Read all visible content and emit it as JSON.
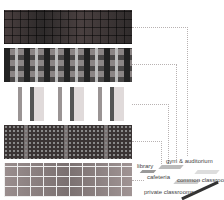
{
  "diagram": {
    "layers": [
      {
        "id": "layer-1",
        "label": "gym & auditorium"
      },
      {
        "id": "layer-2",
        "label": "common classrooms"
      },
      {
        "id": "layer-3",
        "label": "library"
      },
      {
        "id": "layer-4",
        "label": "cafeteria"
      },
      {
        "id": "layer-5",
        "label": "private classrooms"
      }
    ],
    "labels": {
      "library": "library",
      "gym": "gym & auditorium",
      "cafeteria": "cafeteria",
      "common": "common classrooms",
      "private": "private classrooms"
    }
  }
}
